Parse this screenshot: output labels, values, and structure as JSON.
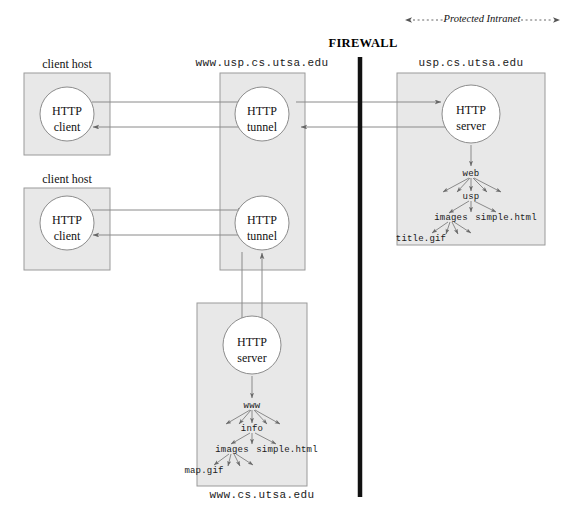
{
  "diagram": {
    "title_firewall": "FIREWALL",
    "protected_label": "Protected Intranet",
    "colors": {
      "box_fill": "#e8e8e8",
      "box_stroke": "#9a9a9a",
      "circle_fill": "#ffffff",
      "circle_stroke": "#8c8c8c",
      "line": "#777777",
      "firewall": "#111111",
      "text": "#111111"
    },
    "hosts": [
      {
        "id": "client-host-1",
        "caption": "client host",
        "node_top": "HTTP",
        "node_bottom": "client"
      },
      {
        "id": "client-host-2",
        "caption": "client host",
        "node_top": "HTTP",
        "node_bottom": "client"
      }
    ],
    "proxy_box": {
      "id": "proxy-host",
      "caption": "www.usp.cs.utsa.edu",
      "nodes": [
        {
          "id": "tunnel-1",
          "top": "HTTP",
          "bottom": "tunnel"
        },
        {
          "id": "tunnel-2",
          "top": "HTTP",
          "bottom": "tunnel"
        }
      ]
    },
    "intranet_server_box": {
      "id": "intranet-server-host",
      "caption": "usp.cs.utsa.edu",
      "node": {
        "top": "HTTP",
        "bottom": "server"
      },
      "tree": {
        "root": "web",
        "level2": "usp",
        "level3_left": "images",
        "level3_right": "simple.html",
        "level4": "title.gif"
      }
    },
    "public_server_box": {
      "id": "public-server-host",
      "caption": "www.cs.utsa.edu",
      "node": {
        "top": "HTTP",
        "bottom": "server"
      },
      "tree": {
        "root": "www",
        "level2": "info",
        "level3_left": "images",
        "level3_right": "simple.html",
        "level4": "map.gif"
      }
    }
  }
}
